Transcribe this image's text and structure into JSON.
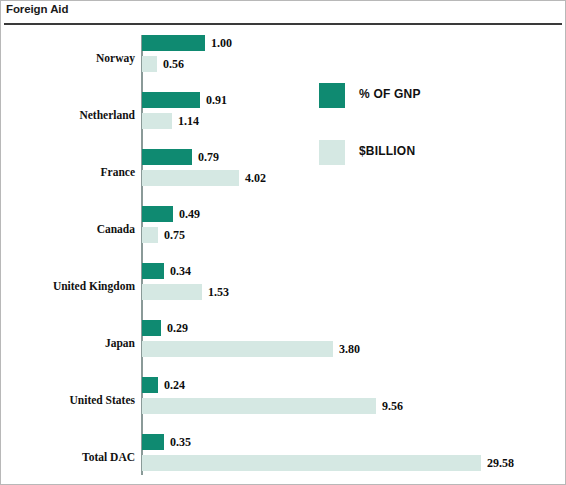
{
  "header": {
    "title": "Foreign Aid"
  },
  "legend": {
    "position": "inside-top-right",
    "items": [
      {
        "label": "% OF GNP",
        "color": "#0f8a71",
        "swatch": "dark"
      },
      {
        "label": "$BILLION",
        "color": "#d5e8e3",
        "swatch": "light"
      }
    ]
  },
  "chart_data": {
    "type": "bar",
    "orientation": "horizontal",
    "title": "Foreign Aid",
    "xlabel": "",
    "ylabel": "",
    "grid": false,
    "legend_position": "inside-top-right",
    "categories": [
      "Norway",
      "Netherland",
      "France",
      "Canada",
      "United Kingdom",
      "Japan",
      "United States",
      "Total DAC"
    ],
    "series": [
      {
        "name": "% OF GNP",
        "color": "#0f8a71",
        "values": [
          1.0,
          0.91,
          0.79,
          0.49,
          0.34,
          0.29,
          0.24,
          0.35
        ],
        "labels": [
          "1.00",
          "0.91",
          "0.79",
          "0.49",
          "0.34",
          "0.29",
          "0.24",
          "0.35"
        ],
        "bar_px": [
          63,
          58,
          50,
          31,
          22,
          19,
          16,
          22
        ]
      },
      {
        "name": "$BILLION",
        "color": "#d5e8e3",
        "values": [
          0.56,
          1.14,
          4.02,
          0.75,
          1.53,
          3.8,
          9.56,
          29.58
        ],
        "labels": [
          "0.56",
          "1.14",
          "4.02",
          "0.75",
          "1.53",
          "3.80",
          "9.56",
          "29.58"
        ],
        "bar_px": [
          15,
          30,
          97,
          16,
          60,
          191,
          234,
          339
        ]
      }
    ]
  }
}
